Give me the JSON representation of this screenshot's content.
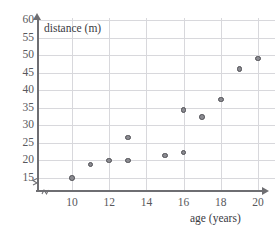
{
  "chart_data": {
    "type": "scatter",
    "title": "",
    "xlabel": "age (years)",
    "ylabel": "distance (m)",
    "xlim": [
      9,
      20
    ],
    "ylim": [
      13,
      60
    ],
    "xticks": [
      10,
      12,
      14,
      16,
      18,
      20
    ],
    "yticks": [
      15,
      20,
      25,
      30,
      35,
      40,
      45,
      50,
      55,
      60
    ],
    "grid": true,
    "legend": "none",
    "axis_break_x": true,
    "axis_break_y": true,
    "points": [
      {
        "x": 10,
        "y": 15.0
      },
      {
        "x": 11,
        "y": 18.8
      },
      {
        "x": 12,
        "y": 20.0
      },
      {
        "x": 13,
        "y": 20.0
      },
      {
        "x": 13,
        "y": 26.5
      },
      {
        "x": 15,
        "y": 21.4
      },
      {
        "x": 16,
        "y": 22.3
      },
      {
        "x": 16,
        "y": 34.3
      },
      {
        "x": 17,
        "y": 32.3
      },
      {
        "x": 18,
        "y": 37.3
      },
      {
        "x": 19,
        "y": 46.0
      },
      {
        "x": 20,
        "y": 49.0
      }
    ],
    "marker_color": "#8a8a90",
    "marker_edge_color": "#4e4e53",
    "grid_color": "#d8d8dc",
    "axis_color": "#6e6e72"
  }
}
